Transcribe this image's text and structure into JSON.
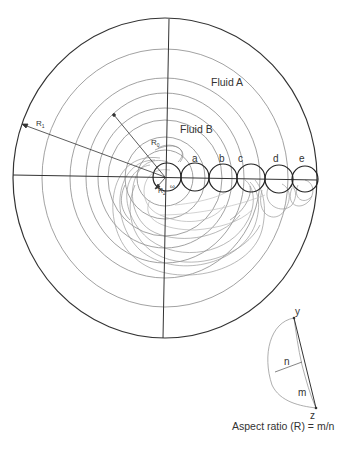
{
  "diagram": {
    "labels": {
      "fluid_a": "Fluid A",
      "fluid_b": "Fluid B",
      "r1": "R",
      "r1_sub": "1",
      "r0": "R",
      "r0_sub": "0",
      "r2": "R",
      "r2_sub": "2",
      "omega": "ω"
    },
    "positions": [
      "a",
      "b",
      "c",
      "d",
      "e"
    ],
    "inset": {
      "point_top": "y",
      "point_bottom": "z",
      "width_label": "n",
      "length_label": "m",
      "caption": "Aspect ratio (R) = m/n"
    },
    "colors": {
      "line": "#333333",
      "ring": "#888888",
      "trace": "#999999"
    }
  }
}
